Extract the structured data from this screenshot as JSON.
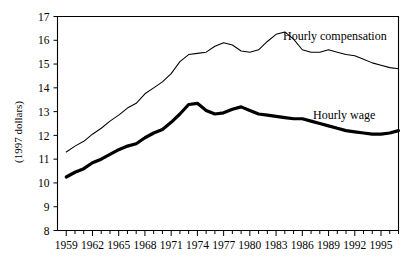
{
  "chart_data": {
    "type": "line",
    "title": "",
    "subtitle": "",
    "xlabel": "",
    "ylabel": "(1997 dollars)",
    "xlim": [
      1958,
      1997
    ],
    "ylim": [
      8,
      17
    ],
    "grid": false,
    "legend_position": "inline-right",
    "y_ticks": [
      8,
      9,
      10,
      11,
      12,
      13,
      14,
      15,
      16,
      17
    ],
    "y_tick_labels": [
      "8",
      "9",
      "10",
      "11",
      "12",
      "13",
      "14",
      "15",
      "16",
      "17"
    ],
    "x_tick_labels": [
      "1959",
      "1962",
      "1965",
      "1968",
      "1971",
      "1974",
      "1977",
      "1980",
      "1983",
      "1986",
      "1989",
      "1992",
      "1995"
    ],
    "x_tick_values": [
      1959,
      1962,
      1965,
      1968,
      1971,
      1974,
      1977,
      1980,
      1983,
      1986,
      1989,
      1992,
      1995
    ],
    "x_minor_tick_values": [
      1959,
      1960,
      1961,
      1962,
      1963,
      1964,
      1965,
      1966,
      1967,
      1968,
      1969,
      1970,
      1971,
      1972,
      1973,
      1974,
      1975,
      1976,
      1977,
      1978,
      1979,
      1980,
      1981,
      1982,
      1983,
      1984,
      1985,
      1986,
      1987,
      1988,
      1989,
      1990,
      1991,
      1992,
      1993,
      1994,
      1995,
      1996,
      1997
    ],
    "x": [
      1959,
      1960,
      1961,
      1962,
      1963,
      1964,
      1965,
      1966,
      1967,
      1968,
      1969,
      1970,
      1971,
      1972,
      1973,
      1974,
      1975,
      1976,
      1977,
      1978,
      1979,
      1980,
      1981,
      1982,
      1983,
      1984,
      1985,
      1986,
      1987,
      1988,
      1989,
      1990,
      1991,
      1992,
      1993,
      1994,
      1995,
      1996,
      1997
    ],
    "series": [
      {
        "name": "Hourly compensation",
        "style": "thin",
        "label": "Hourly compensation",
        "values": [
          11.3,
          11.55,
          11.75,
          12.05,
          12.3,
          12.6,
          12.85,
          13.15,
          13.35,
          13.75,
          14.0,
          14.25,
          14.6,
          15.1,
          15.4,
          15.45,
          15.5,
          15.75,
          15.9,
          15.8,
          15.55,
          15.5,
          15.6,
          15.95,
          16.25,
          16.35,
          16.05,
          15.6,
          15.5,
          15.5,
          15.6,
          15.5,
          15.4,
          15.35,
          15.2,
          15.05,
          14.95,
          14.85,
          14.8
        ]
      },
      {
        "name": "Hourly wage",
        "style": "thick",
        "label": "Hourly wage",
        "values": [
          10.25,
          10.45,
          10.6,
          10.85,
          11.0,
          11.2,
          11.4,
          11.55,
          11.65,
          11.9,
          12.1,
          12.25,
          12.55,
          12.9,
          13.3,
          13.35,
          13.05,
          12.9,
          12.95,
          13.1,
          13.2,
          13.05,
          12.9,
          12.85,
          12.8,
          12.75,
          12.7,
          12.7,
          12.6,
          12.5,
          12.4,
          12.3,
          12.2,
          12.15,
          12.1,
          12.05,
          12.05,
          12.1,
          12.2
        ]
      }
    ]
  },
  "labels": {
    "y_axis_title": "(1997 dollars)",
    "compensation_label": "Hourly compensation",
    "wage_label": "Hourly wage"
  }
}
